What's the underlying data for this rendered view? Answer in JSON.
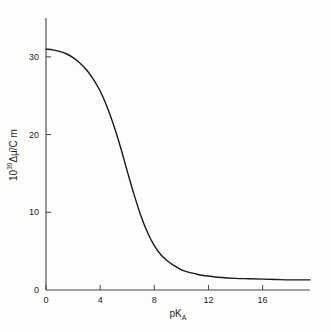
{
  "chart_data": {
    "type": "line",
    "title": "",
    "subtitle": "",
    "xlabel": "pK_A",
    "xlabel_base": "pK",
    "xlabel_sub": "A",
    "ylabel": "10^30 Δμ̄/C m",
    "ylabel_prefix": "10",
    "ylabel_exponent": "30",
    "ylabel_suffix": "Δμ̄/C m",
    "xlim": [
      0,
      19.5
    ],
    "ylim": [
      0,
      35
    ],
    "xticks": [
      0,
      4,
      8,
      12,
      16
    ],
    "xtick_labels": [
      "0",
      "4",
      "8",
      "12",
      "16"
    ],
    "yticks": [
      0,
      10,
      20,
      30
    ],
    "ytick_labels": [
      "0",
      "10",
      "20",
      "30"
    ],
    "grid": false,
    "legend": "none",
    "line_color": "#1a1a1a",
    "line_width": 1.4,
    "axis_color": "#444444",
    "background_color": "#fdfdfc",
    "series": [
      {
        "name": "Δμ̄ vs pK_A",
        "x": [
          0.0,
          0.5,
          1.0,
          1.5,
          2.0,
          2.5,
          3.0,
          3.5,
          4.0,
          4.5,
          5.0,
          5.5,
          6.0,
          6.5,
          7.0,
          7.5,
          8.0,
          8.5,
          9.0,
          9.5,
          10.0,
          10.5,
          11.0,
          11.5,
          12.0,
          13.0,
          14.0,
          15.0,
          16.0,
          17.0,
          18.0,
          19.0,
          19.5
        ],
        "y": [
          31.0,
          30.9,
          30.7,
          30.4,
          29.9,
          29.2,
          28.3,
          27.1,
          25.6,
          23.6,
          21.2,
          18.4,
          15.3,
          12.3,
          9.6,
          7.4,
          5.7,
          4.5,
          3.7,
          3.1,
          2.6,
          2.3,
          2.1,
          1.9,
          1.8,
          1.6,
          1.5,
          1.45,
          1.4,
          1.35,
          1.3,
          1.3,
          1.3
        ]
      }
    ],
    "annotations": []
  },
  "geometry": {
    "plot_left": 46,
    "plot_right": 310,
    "plot_top": 18,
    "plot_bottom": 290
  }
}
